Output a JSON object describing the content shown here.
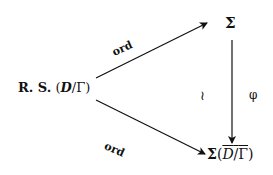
{
  "diagram": {
    "type": "commutative-diagram",
    "nodes": {
      "source": {
        "prefix": "R. S.",
        "open": " (",
        "D": "D",
        "slash": "/",
        "Gamma": "Γ",
        "close": ")"
      },
      "top_right": {
        "label": "Σ"
      },
      "bottom_right": {
        "sigma": "Σ",
        "open": "(",
        "D": "D",
        "slash": "/",
        "Gamma": "Γ",
        "close": ")"
      }
    },
    "edges": [
      {
        "from": "source",
        "to": "top_right",
        "label": "ord"
      },
      {
        "from": "source",
        "to": "bottom_right",
        "label": "ord"
      },
      {
        "from": "top_right",
        "to": "bottom_right",
        "label_left": "≀",
        "label_right": "φ"
      }
    ]
  }
}
